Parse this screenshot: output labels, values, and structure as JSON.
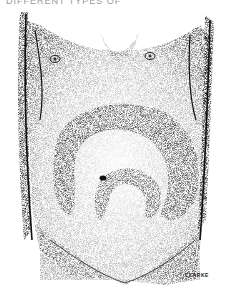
{
  "caption": "DIFFERENT TYPES OF",
  "illustration": {
    "subject": "stippled anatomical drawing of abdomen with visible bowel loops",
    "ink_color": "#111111",
    "background": "#ffffff"
  },
  "signature": "CLARKE"
}
